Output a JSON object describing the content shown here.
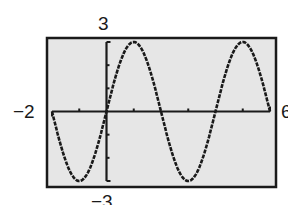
{
  "chart_data": {
    "type": "line",
    "title": "",
    "xlabel": "",
    "ylabel": "",
    "xlim": [
      -2,
      6
    ],
    "ylim": [
      -3,
      3
    ],
    "function": "y = 3 sin(pi x / 2)",
    "amplitude": 3,
    "period": 4,
    "x_ticks": [
      -1,
      1,
      3,
      5
    ],
    "y_ticks": [
      -2,
      -1,
      1,
      2
    ],
    "grid": false,
    "legend": null,
    "series": [
      {
        "name": "y = 3 sin(πx/2)",
        "x": [
          -2,
          -1.5,
          -1,
          -0.5,
          0,
          0.5,
          1,
          1.5,
          2,
          2.5,
          3,
          3.5,
          4,
          4.5,
          5,
          5.5,
          6
        ],
        "values": [
          0,
          -2.12,
          -3,
          -2.12,
          0,
          2.12,
          3,
          2.12,
          0,
          -2.12,
          -3,
          -2.12,
          0,
          2.12,
          3,
          2.12,
          0
        ]
      }
    ],
    "window_labels": {
      "xmin": "−2",
      "xmax": "6",
      "ymax": "3",
      "ymin": "−3"
    }
  },
  "colors": {
    "background": "#ffffff",
    "screen": "#e6e6e6",
    "frame": "#1a1a1a",
    "curve": "#1a1a1a"
  }
}
